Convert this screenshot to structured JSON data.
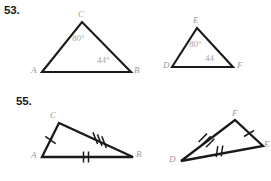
{
  "page": {
    "background_color": "#ffffff",
    "width": 271,
    "height": 181,
    "stroke_color": "#1a1a1a",
    "label_color": "#9a9a9a"
  },
  "problems": [
    {
      "number": "53.",
      "figures": [
        {
          "name": "triangle-abc",
          "vertices": [
            {
              "label": "A",
              "x": 42,
              "y": 72
            },
            {
              "label": "C",
              "x": 82,
              "y": 22
            },
            {
              "label": "B",
              "x": 131,
              "y": 72
            }
          ],
          "vertex_label_positions": [
            {
              "label": "A",
              "x": 31,
              "y": 66
            },
            {
              "label": "C",
              "x": 78,
              "y": 10
            },
            {
              "label": "B",
              "x": 134,
              "y": 66
            }
          ],
          "angles": [
            {
              "value": "80°",
              "at_vertex": "C",
              "x": 72,
              "y": 34
            },
            {
              "value": "44°",
              "at_vertex": "B",
              "x": 97,
              "y": 56
            }
          ],
          "tick_marks": []
        },
        {
          "name": "triangle-def",
          "vertices": [
            {
              "label": "D",
              "x": 172,
              "y": 67
            },
            {
              "label": "E",
              "x": 197,
              "y": 28
            },
            {
              "label": "F",
              "x": 233,
              "y": 67
            }
          ],
          "vertex_label_positions": [
            {
              "label": "D",
              "x": 163,
              "y": 61
            },
            {
              "label": "E",
              "x": 193,
              "y": 16
            },
            {
              "label": "F",
              "x": 237,
              "y": 61
            }
          ],
          "angles": [
            {
              "value": "80°",
              "at_vertex": "E",
              "x": 189,
              "y": 40
            },
            {
              "value": "44",
              "at_vertex": "F",
              "x": 205,
              "y": 54
            }
          ],
          "tick_marks": []
        }
      ]
    },
    {
      "number": "55.",
      "figures": [
        {
          "name": "triangle-acb",
          "vertices": [
            {
              "label": "A",
              "x": 42,
              "y": 157
            },
            {
              "label": "C",
              "x": 59,
              "y": 123
            },
            {
              "label": "B",
              "x": 133,
              "y": 157
            }
          ],
          "vertex_label_positions": [
            {
              "label": "A",
              "x": 31,
              "y": 151
            },
            {
              "label": "C",
              "x": 50,
              "y": 111
            },
            {
              "label": "B",
              "x": 136,
              "y": 150
            }
          ],
          "angles": [],
          "tick_marks": [
            {
              "side": "A-C",
              "count": 1
            },
            {
              "side": "C-B",
              "count": 3
            },
            {
              "side": "A-B",
              "count": 2
            }
          ]
        },
        {
          "name": "triangle-dfe",
          "vertices": [
            {
              "label": "D",
              "x": 181,
              "y": 161
            },
            {
              "label": "F",
              "x": 235,
              "y": 120
            },
            {
              "label": "E",
              "x": 263,
              "y": 146
            }
          ],
          "vertex_label_positions": [
            {
              "label": "D",
              "x": 169,
              "y": 155
            },
            {
              "label": "F",
              "x": 232,
              "y": 109
            },
            {
              "label": "E",
              "x": 264,
              "y": 140
            }
          ],
          "angles": [],
          "tick_marks": [
            {
              "side": "D-F",
              "count": 3
            },
            {
              "side": "F-E",
              "count": 1
            },
            {
              "side": "D-E",
              "count": 2
            }
          ]
        }
      ]
    }
  ]
}
